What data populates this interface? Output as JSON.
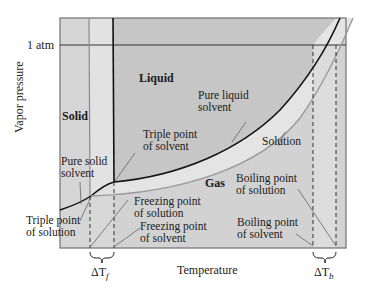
{
  "diagram": {
    "type": "phase-diagram",
    "axes": {
      "x_label": "Temperature",
      "y_label": "Vapor pressure",
      "y_tick": "1 atm"
    },
    "regions": {
      "solid": "Solid",
      "liquid": "Liquid",
      "gas": "Gas"
    },
    "curves": {
      "pure_liquid_solvent_line1": "Pure liquid",
      "pure_liquid_solvent_line2": "solvent",
      "solution": "Solution",
      "pure_solid_solvent_line1": "Pure solid",
      "pure_solid_solvent_line2": "solvent"
    },
    "annotations": {
      "triple_point_solvent_line1": "Triple point",
      "triple_point_solvent_line2": "of solvent",
      "triple_point_solution_line1": "Triple point",
      "triple_point_solution_line2": "of solution",
      "freezing_point_solution_line1": "Freezing point",
      "freezing_point_solution_line2": "of solution",
      "freezing_point_solvent_line1": "Freezing point",
      "freezing_point_solvent_line2": "of solvent",
      "boiling_point_solution_line1": "Boiling point",
      "boiling_point_solution_line2": "of solution",
      "boiling_point_solvent_line1": "Boiling point",
      "boiling_point_solvent_line2": "of solvent"
    },
    "deltas": {
      "freezing": {
        "symbol": "ΔT",
        "subscript": "f"
      },
      "boiling": {
        "symbol": "ΔT",
        "subscript": "b"
      }
    },
    "colors": {
      "background_dark": "#c8c8c8",
      "background_mid": "#d6d6d6",
      "band_light": "#e4e4e4",
      "solvent_curve": "#111111",
      "solution_curve": "#9a9a9a",
      "frame": "#707070"
    }
  }
}
